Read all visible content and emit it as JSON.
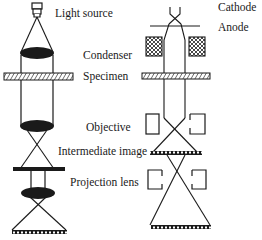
{
  "diagram": {
    "labels": {
      "light_source": "Light source",
      "condenser": "Condenser",
      "specimen": "Specimen",
      "objective": "Objective",
      "intermediate_image": "Intermediate image",
      "projection_lens": "Projection lens",
      "cathode": "Cathode",
      "anode": "Anode"
    },
    "colors": {
      "ink": "#1a1a1a",
      "background": "#ffffff"
    },
    "columns": [
      {
        "name": "light-microscope",
        "components": [
          "light-source",
          "condenser-lens",
          "specimen",
          "objective-lens",
          "intermediate-image",
          "projection-lens",
          "final-image"
        ]
      },
      {
        "name": "electron-microscope",
        "components": [
          "cathode",
          "anode",
          "condenser-coils",
          "specimen",
          "objective-coils",
          "intermediate-image",
          "projection-coils",
          "final-image"
        ]
      }
    ]
  }
}
